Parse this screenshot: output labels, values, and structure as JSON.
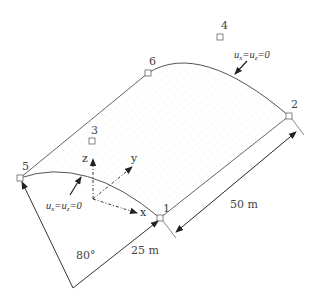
{
  "diagram": {
    "nodes": [
      {
        "id": "1",
        "label": "1"
      },
      {
        "id": "2",
        "label": "2"
      },
      {
        "id": "3",
        "label": "3"
      },
      {
        "id": "4",
        "label": "4"
      },
      {
        "id": "5",
        "label": "5"
      },
      {
        "id": "6",
        "label": "6"
      }
    ],
    "boundary_conditions": {
      "back": {
        "u1": "u",
        "s1": "x",
        "eq": "=",
        "u2": "u",
        "s2": "z",
        "val": "=0"
      },
      "front": {
        "u1": "u",
        "s1": "x",
        "eq": "=",
        "u2": "u",
        "s2": "z",
        "val": "=0"
      }
    },
    "axes": {
      "x": "x",
      "y": "y",
      "z": "z"
    },
    "dimensions": {
      "length": "50 m",
      "radius": "25 m",
      "angle": "80°"
    },
    "colors": {
      "line": "#555555",
      "arrow": "#222222",
      "text": "#333333"
    }
  }
}
